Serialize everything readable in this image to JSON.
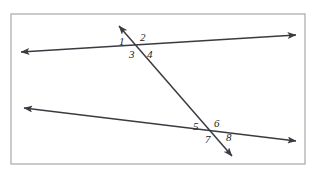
{
  "figure": {
    "canvas": {
      "width": 319,
      "height": 178
    },
    "background_color": "#ffffff",
    "border": {
      "name": "figure-border",
      "color": "#a8a8a8",
      "stroke_width": 1.2,
      "x": 11,
      "y": 14,
      "width": 294,
      "height": 150
    },
    "line_color": "#3a3a42",
    "line_stroke_width": 1.5,
    "lines": [
      {
        "name": "upper-parallel-line",
        "role": "parallel-line-top",
        "x1": 21,
        "y1": 52,
        "x2": 296,
        "y2": 35,
        "arrow_start": true,
        "arrow_end": true
      },
      {
        "name": "lower-parallel-line",
        "role": "parallel-line-bottom",
        "x1": 24,
        "y1": 108,
        "x2": 296,
        "y2": 141,
        "arrow_start": true,
        "arrow_end": true
      },
      {
        "name": "transversal-line",
        "role": "transversal",
        "x1": 119,
        "y1": 26,
        "x2": 232,
        "y2": 156,
        "arrow_start": true,
        "arrow_end": true
      }
    ],
    "intersections": [
      {
        "name": "upper-intersection",
        "x": 137,
        "y": 46
      },
      {
        "name": "lower-intersection",
        "x": 211,
        "y": 131
      }
    ],
    "angle_labels": [
      {
        "name": "angle-label-1",
        "text": "1",
        "x": 119,
        "y": 36,
        "intersection": "upper-intersection",
        "position": "upper-left"
      },
      {
        "name": "angle-label-2",
        "text": "2",
        "x": 140,
        "y": 32,
        "intersection": "upper-intersection",
        "position": "upper-right"
      },
      {
        "name": "angle-label-3",
        "text": "3",
        "x": 129,
        "y": 49,
        "intersection": "upper-intersection",
        "position": "lower-left"
      },
      {
        "name": "angle-label-4",
        "text": "4",
        "x": 147,
        "y": 49,
        "intersection": "upper-intersection",
        "position": "lower-right"
      },
      {
        "name": "angle-label-5",
        "text": "5",
        "x": 193,
        "y": 121,
        "intersection": "lower-intersection",
        "position": "upper-left"
      },
      {
        "name": "angle-label-6",
        "text": "6",
        "x": 214,
        "y": 118,
        "intersection": "lower-intersection",
        "position": "upper-right"
      },
      {
        "name": "angle-label-7",
        "text": "7",
        "x": 205,
        "y": 134,
        "intersection": "lower-intersection",
        "position": "lower-left"
      },
      {
        "name": "angle-label-8",
        "text": "8",
        "x": 226,
        "y": 132,
        "intersection": "lower-intersection",
        "position": "lower-right"
      }
    ]
  }
}
